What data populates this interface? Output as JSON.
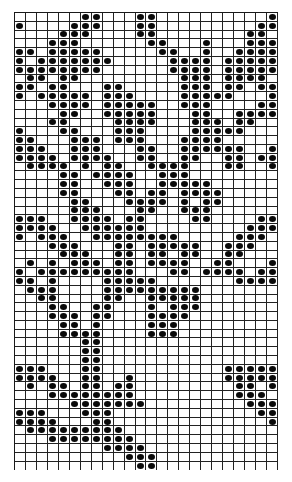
{
  "chart_data": {
    "type": "table",
    "title": "",
    "columns": 24,
    "rows": 52,
    "dot_color": "#0a0a0a",
    "grid_color": "#222222",
    "filled": [
      [
        7,
        8,
        12,
        13,
        24
      ],
      [
        1,
        6,
        7,
        8,
        12,
        13,
        23,
        24
      ],
      [
        5,
        6,
        7,
        12,
        13,
        22,
        23
      ],
      [
        4,
        5,
        6,
        13,
        14,
        18,
        22,
        23,
        24
      ],
      [
        1,
        2,
        4,
        5,
        6,
        7,
        8,
        14,
        15,
        18,
        21,
        22,
        23,
        24
      ],
      [
        1,
        3,
        4,
        5,
        6,
        7,
        8,
        9,
        15,
        16,
        17,
        18,
        20,
        21,
        22,
        23,
        24
      ],
      [
        1,
        2,
        3,
        4,
        5,
        6,
        7,
        8,
        15,
        16,
        17,
        18,
        20,
        21,
        22,
        23,
        24
      ],
      [
        2,
        3,
        5,
        6,
        16,
        17,
        18,
        20,
        21,
        22,
        23
      ],
      [
        1,
        2,
        4,
        5,
        9,
        10,
        16,
        17,
        18,
        20,
        21,
        23,
        24
      ],
      [
        1,
        3,
        4,
        5,
        6,
        7,
        9,
        10,
        11,
        16,
        17,
        18,
        19,
        20,
        24
      ],
      [
        4,
        5,
        6,
        7,
        9,
        10,
        11,
        12,
        13,
        16,
        17,
        18,
        23,
        24
      ],
      [
        5,
        6,
        9,
        10,
        11,
        12,
        13,
        17,
        18,
        21,
        22,
        23,
        24
      ],
      [
        4,
        5,
        10,
        11,
        12,
        13,
        17,
        18,
        19,
        21,
        22
      ],
      [
        1,
        5,
        6,
        10,
        11,
        12,
        17,
        18,
        19,
        20,
        21
      ],
      [
        1,
        2,
        6,
        7,
        8,
        10,
        11,
        12,
        16,
        17,
        18,
        19
      ],
      [
        1,
        2,
        3,
        6,
        7,
        8,
        12,
        13,
        16,
        17,
        18,
        19,
        20,
        21,
        24
      ],
      [
        1,
        2,
        3,
        4,
        6,
        7,
        8,
        9,
        12,
        13,
        16,
        17,
        20,
        21,
        23,
        24
      ],
      [
        2,
        3,
        4,
        5,
        7,
        9,
        10,
        13,
        14,
        15,
        16,
        20,
        21,
        24
      ],
      [
        5,
        6,
        8,
        9,
        10,
        11,
        14,
        15,
        16
      ],
      [
        5,
        6,
        9,
        10,
        11,
        14,
        15,
        16,
        17,
        18
      ],
      [
        5,
        6,
        10,
        11,
        13,
        14,
        16,
        17,
        18,
        19
      ],
      [
        6,
        7,
        11,
        12,
        13,
        14,
        16,
        18,
        19
      ],
      [
        6,
        7,
        8,
        12,
        13,
        16,
        17,
        18
      ],
      [
        1,
        2,
        3,
        6,
        7,
        8,
        9,
        11,
        12,
        17,
        18,
        23,
        24
      ],
      [
        1,
        2,
        3,
        4,
        7,
        8,
        9,
        10,
        11,
        12,
        22,
        23,
        24
      ],
      [
        1,
        3,
        4,
        5,
        8,
        9,
        10,
        11,
        12,
        13,
        14,
        15,
        21,
        22,
        23
      ],
      [
        4,
        5,
        6,
        10,
        11,
        13,
        14,
        15,
        16,
        17,
        20,
        21,
        22
      ],
      [
        5,
        6,
        7,
        10,
        11,
        13,
        14,
        16,
        17,
        20,
        21
      ],
      [
        2,
        4,
        6,
        7,
        8,
        10,
        11,
        13,
        14,
        15,
        16,
        19,
        20,
        24
      ],
      [
        1,
        3,
        4,
        5,
        6,
        7,
        8,
        9,
        10,
        11,
        15,
        16,
        18,
        19,
        20,
        21,
        23,
        24
      ],
      [
        1,
        2,
        4,
        9,
        10,
        11,
        12,
        13,
        21,
        22,
        23,
        24
      ],
      [
        2,
        3,
        4,
        9,
        10,
        11,
        12,
        13,
        14,
        15,
        16,
        17
      ],
      [
        3,
        4,
        9,
        10,
        13,
        14,
        15,
        16,
        17
      ],
      [
        4,
        5,
        8,
        9,
        13,
        15,
        16,
        17
      ],
      [
        4,
        5,
        6,
        8,
        9,
        13,
        14,
        15,
        16
      ],
      [
        5,
        6,
        8,
        13,
        14,
        15
      ],
      [
        5,
        6,
        7,
        8,
        13,
        14,
        15
      ],
      [
        7,
        8
      ],
      [
        7,
        8
      ],
      [
        7,
        8
      ],
      [
        1,
        2,
        3,
        7,
        8,
        20,
        21,
        22,
        23,
        24
      ],
      [
        1,
        2,
        3,
        4,
        7,
        8,
        11,
        20,
        21,
        22,
        23,
        24
      ],
      [
        2,
        4,
        5,
        7,
        8,
        10,
        11,
        21,
        22,
        24
      ],
      [
        4,
        5,
        6,
        7,
        8,
        9,
        10,
        11,
        21,
        22,
        23
      ],
      [
        6,
        7,
        8,
        9,
        10,
        11,
        12,
        22,
        23,
        24
      ],
      [
        1,
        2,
        3,
        7,
        8,
        9,
        23,
        24
      ],
      [
        1,
        2,
        3,
        4,
        8,
        9,
        24
      ],
      [
        2,
        3,
        4,
        5,
        6,
        7,
        8,
        9,
        10
      ],
      [
        4,
        5,
        6,
        7,
        8,
        9,
        10,
        11
      ],
      [
        9,
        10,
        11,
        12
      ],
      [
        11,
        12,
        13
      ],
      [
        12,
        13
      ]
    ]
  }
}
